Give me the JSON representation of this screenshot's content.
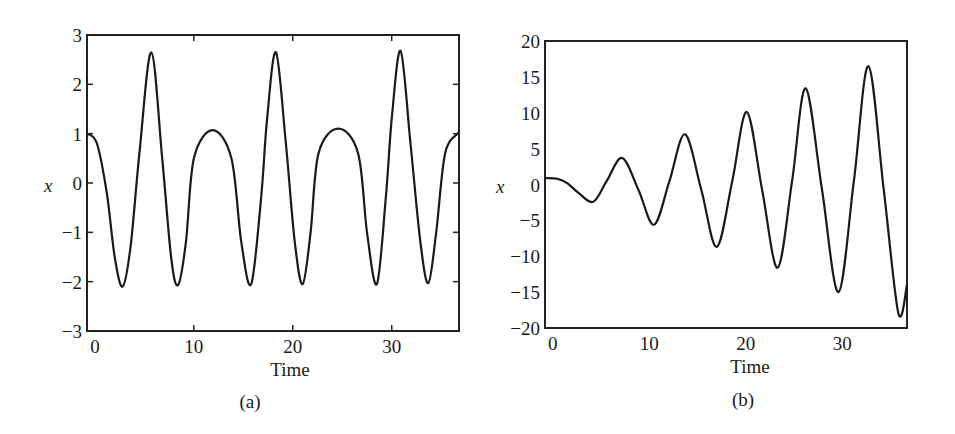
{
  "chart_data": [
    {
      "type": "line",
      "caption": "(a)",
      "title": "",
      "xlabel": "Time",
      "ylabel": "x",
      "xlim": [
        -0.8,
        36.8
      ],
      "ylim": [
        -3,
        3
      ],
      "xticks": [
        0,
        10,
        20,
        30
      ],
      "xtick_labels": [
        "0",
        "10",
        "20",
        "30"
      ],
      "yticks": [
        3,
        2,
        1,
        0,
        -1,
        -2,
        -3
      ],
      "ytick_labels": [
        "3",
        "2",
        "1",
        "0",
        "−1",
        "−2",
        "−3"
      ],
      "grid": false,
      "legend": null,
      "series": [
        {
          "name": "x(t)",
          "x": [
            -0.8,
            0.2,
            1.2,
            2.0,
            2.8,
            3.6,
            4.5,
            5.7,
            6.8,
            7.7,
            8.4,
            9.2,
            10.0,
            11.9,
            13.8,
            14.8,
            15.8,
            16.8,
            17.4,
            18.3,
            19.3,
            20.2,
            21.0,
            21.8,
            22.6,
            24.6,
            26.6,
            27.5,
            28.5,
            29.4,
            30.0,
            30.9,
            31.9,
            32.9,
            33.7,
            34.5,
            35.4,
            36.8
          ],
          "y": [
            1.0,
            0.8,
            -0.2,
            -1.5,
            -2.1,
            -1.3,
            0.6,
            2.65,
            0.5,
            -1.5,
            -2.07,
            -1.2,
            0.5,
            1.07,
            0.5,
            -1.2,
            -2.05,
            -0.3,
            1.3,
            2.65,
            0.8,
            -1.2,
            -2.05,
            -1.0,
            0.6,
            1.1,
            0.6,
            -1.0,
            -2.05,
            -0.3,
            1.3,
            2.68,
            0.8,
            -1.2,
            -2.03,
            -1.0,
            0.6,
            1.03
          ]
        }
      ]
    },
    {
      "type": "line",
      "caption": "(b)",
      "title": "",
      "xlabel": "Time",
      "ylabel": "x",
      "xlim": [
        -0.8,
        36.7
      ],
      "ylim": [
        -20,
        20
      ],
      "xticks": [
        0,
        10,
        20,
        30
      ],
      "xtick_labels": [
        "0",
        "10",
        "20",
        "30"
      ],
      "yticks": [
        20,
        15,
        10,
        5,
        0,
        -5,
        -10,
        -15,
        -20
      ],
      "ytick_labels": [
        "20",
        "15",
        "10",
        "5",
        "0",
        "−5",
        "−10",
        "−15",
        "−20"
      ],
      "grid": false,
      "legend": null,
      "series": [
        {
          "name": "x(t)",
          "x": [
            -0.8,
            0.5,
            1.5,
            2.7,
            4.2,
            5.6,
            7.2,
            8.9,
            10.5,
            12.1,
            13.7,
            15.4,
            17.0,
            18.6,
            20.1,
            21.7,
            23.3,
            24.8,
            26.2,
            27.9,
            29.6,
            31.2,
            32.7,
            34.3,
            35.8,
            36.7
          ],
          "y": [
            0.9,
            0.8,
            0.2,
            -1.2,
            -2.4,
            0.5,
            3.7,
            -0.8,
            -5.6,
            0.5,
            7.0,
            -0.8,
            -8.7,
            0.5,
            10.1,
            -0.8,
            -11.6,
            0.5,
            13.4,
            -0.8,
            -15.0,
            0.5,
            16.5,
            -0.8,
            -17.9,
            -14.0
          ]
        }
      ]
    }
  ]
}
